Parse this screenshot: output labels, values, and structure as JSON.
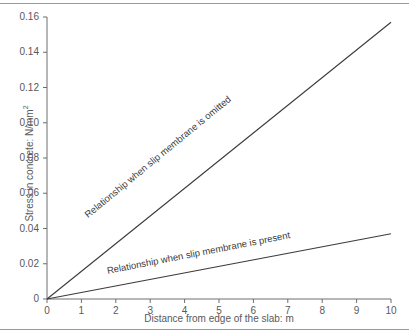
{
  "chart_data": {
    "type": "line",
    "title": "",
    "xlabel": "Distance from edge of the slab: m",
    "ylabel": "Stress in concrete: N/mm",
    "ylabel_superscript": "2",
    "xlim": [
      0,
      10
    ],
    "ylim": [
      0,
      0.16
    ],
    "grid": false,
    "legend_position": "inline-annotations",
    "xticks": [
      "0",
      "1",
      "2",
      "3",
      "4",
      "5",
      "6",
      "7",
      "8",
      "9",
      "10"
    ],
    "xtick_values": [
      0,
      1,
      2,
      3,
      4,
      5,
      6,
      7,
      8,
      9,
      10
    ],
    "yticks": [
      "0",
      "0.02",
      "0.04",
      "0.06",
      "0.08",
      "0.10",
      "0.12",
      "0.14",
      "0.16"
    ],
    "ytick_values": [
      0,
      0.02,
      0.04,
      0.06,
      0.08,
      0.1,
      0.12,
      0.14,
      0.16
    ],
    "x": [
      0,
      10
    ],
    "series": [
      {
        "name": "Relationship when slip membrane is omitted",
        "values": [
          0,
          0.157
        ],
        "color": "#3b3b3b"
      },
      {
        "name": "Relationship when slip membrane is present",
        "values": [
          0,
          0.037
        ],
        "color": "#3b3b3b"
      }
    ],
    "annotations": [
      {
        "text": "Relationship when slip membrane is omitted",
        "series": "Relationship when slip membrane is omitted"
      },
      {
        "text": "Relationship when slip membrane is present",
        "series": "Relationship when slip membrane is present"
      }
    ]
  },
  "colors": {
    "axis": "#6e6e6e",
    "line": "#3b3b3b",
    "text": "#58595b",
    "frame": "#9a9a9a"
  }
}
